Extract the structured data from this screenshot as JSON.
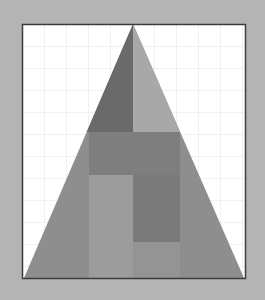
{
  "figure": {
    "background_color": "#b4b4b4",
    "canvas": {
      "x": 22,
      "y": 24,
      "width": 224,
      "height": 255,
      "fill": "#ffffff",
      "border": "#3c3c3c"
    },
    "grid": {
      "spacing": 22,
      "color": "#e4e4e4"
    },
    "triangle": {
      "apex": [
        133,
        24
      ],
      "base_left": [
        24,
        278
      ],
      "base_right": [
        244,
        278
      ],
      "fill": "#8e8e8e"
    },
    "regions": [
      {
        "name": "upper-left-dark",
        "fill": "#6a6a6a"
      },
      {
        "name": "upper-right-light",
        "fill": "#a8a8a8"
      },
      {
        "name": "middle-band",
        "fill": "#7e7e7e"
      },
      {
        "name": "lower-left-light",
        "fill": "#9c9c9c"
      },
      {
        "name": "lower-right-dark",
        "fill": "#7a7a7a"
      }
    ]
  }
}
